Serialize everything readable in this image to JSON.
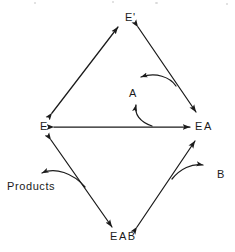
{
  "diagram": {
    "type": "reaction-scheme",
    "background_color": "#ffffff",
    "stroke_color": "#1b1b1b",
    "nodes": [
      {
        "id": "e-prime",
        "label": "E'",
        "x": 125,
        "y": 12
      },
      {
        "id": "e",
        "label": "E",
        "x": 40,
        "y": 121
      },
      {
        "id": "ea",
        "label": "EA",
        "x": 195,
        "y": 121
      },
      {
        "id": "a",
        "label": "A",
        "x": 129,
        "y": 88
      },
      {
        "id": "eab",
        "label": "EAB",
        "x": 110,
        "y": 231
      },
      {
        "id": "products",
        "label": "Products",
        "x": 7,
        "y": 181
      },
      {
        "id": "b",
        "label": "B",
        "x": 217,
        "y": 169
      }
    ],
    "edges": [
      {
        "id": "e-to-eprime",
        "from": "E",
        "to": "E'",
        "style": "double-headed-straight"
      },
      {
        "id": "eprime-to-ea",
        "from": "E'",
        "to": "EA",
        "style": "double-headed-straight"
      },
      {
        "id": "e-to-ea",
        "from": "E",
        "to": "EA",
        "style": "double-headed-straight"
      },
      {
        "id": "e-to-eab",
        "from": "E",
        "to": "EAB",
        "style": "double-headed-straight"
      },
      {
        "id": "eab-to-ea",
        "from": "EAB",
        "to": "EA",
        "style": "double-headed-straight"
      },
      {
        "id": "a-release",
        "from": "EA-to-E'-path",
        "to": "A",
        "style": "curved-arrow"
      },
      {
        "id": "a-bind",
        "from": "A",
        "to": "E-EA-path",
        "style": "curved-arrow"
      },
      {
        "id": "products-release",
        "from": "EAB-to-E-path",
        "to": "Products",
        "style": "curved-arrow"
      },
      {
        "id": "b-release",
        "from": "EAB-to-EA-path",
        "to": "B",
        "style": "curved-arrow"
      }
    ]
  }
}
